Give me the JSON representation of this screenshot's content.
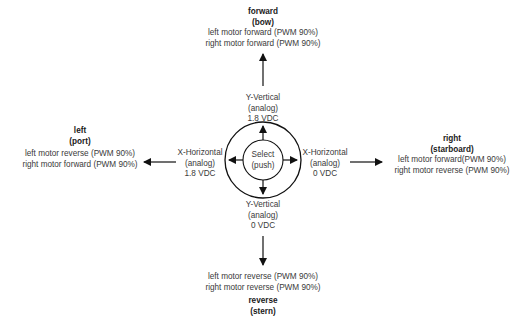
{
  "diagram": {
    "center": {
      "label_line1": "Select",
      "label_line2": "(push)"
    },
    "axes": {
      "up": {
        "line1": "Y-Vertical",
        "line2": "(analog)",
        "line3": "1.8 VDC"
      },
      "down": {
        "line1": "Y-Vertical",
        "line2": "(analog)",
        "line3": "0 VDC"
      },
      "left": {
        "line1": "X-Horizontal",
        "line2": "(analog)",
        "line3": "1.8 VDC"
      },
      "right": {
        "line1": "X-Horizontal",
        "line2": "(analog)",
        "line3": "0 VDC"
      }
    },
    "directions": {
      "forward": {
        "name": "forward",
        "alias": "(bow)",
        "left_motor": "left motor forward (PWM 90%)",
        "right_motor": "right motor forward (PWM 90%)"
      },
      "reverse": {
        "name": "reverse",
        "alias": "(stern)",
        "left_motor": "left motor reverse (PWM 90%)",
        "right_motor": "right motor reverse (PWM 90%)"
      },
      "left": {
        "name": "left",
        "alias": "(port)",
        "left_motor": "left motor reverse (PWM 90%)",
        "right_motor": "right motor forward (PWM 90%)"
      },
      "right": {
        "name": "right",
        "alias": "(starboard)",
        "left_motor": "left motor forward(PWM 90%)",
        "right_motor": "right motor reverse (PWM 90%)"
      }
    },
    "colors": {
      "stroke": "#111111",
      "text": "#3a3a3a",
      "background": "#ffffff"
    }
  }
}
